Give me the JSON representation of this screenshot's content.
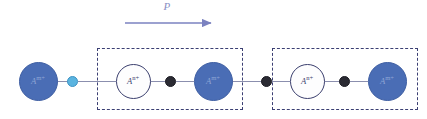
{
  "figure": {
    "width": 427,
    "height": 119,
    "background": "#ffffff",
    "type": "ionic-chain-polarization-schematic"
  },
  "polarization": {
    "label": "P",
    "label_color": "#8a8fc4",
    "arrow_color": "#7b82c0",
    "direction": "right",
    "arrow_x_start": 125,
    "arrow_x_end": 216,
    "arrow_y": 23,
    "label_x": 166,
    "label_y": 8
  },
  "colors": {
    "cation_m_fill": "#4a6db5",
    "cation_m_stroke": "#3f5fa3",
    "cation_m_text": "#8fa6d6",
    "cation_n_fill": "#fdfdfe",
    "cation_n_stroke": "#3b3f6e",
    "cation_n_text": "#3b3f6e",
    "anion_light": "#5ab4e0",
    "anion_dark": "#2b2b33",
    "bond": "#8b8fae",
    "unit_cell_border": "#3b3f73"
  },
  "chain": {
    "baseline_y": 81,
    "bond_segments": [
      {
        "x": 38,
        "width": 30
      },
      {
        "x": 78,
        "width": 38
      },
      {
        "x": 150,
        "width": 16
      },
      {
        "x": 176,
        "width": 18
      },
      {
        "x": 232,
        "width": 30
      },
      {
        "x": 272,
        "width": 18
      },
      {
        "x": 324,
        "width": 16
      },
      {
        "x": 350,
        "width": 18
      }
    ],
    "atoms": [
      {
        "id": "atom-1",
        "species": "A",
        "charge": "m+",
        "style": "filled",
        "cx": 38,
        "cy": 81,
        "d": 39
      },
      {
        "id": "atom-2",
        "species": "A",
        "charge": "n+",
        "style": "open",
        "cx": 133,
        "cy": 81,
        "d": 35
      },
      {
        "id": "atom-3",
        "species": "A",
        "charge": "m+",
        "style": "filled",
        "cx": 213,
        "cy": 81,
        "d": 39
      },
      {
        "id": "atom-4",
        "species": "A",
        "charge": "n+",
        "style": "open",
        "cx": 307,
        "cy": 81,
        "d": 35
      },
      {
        "id": "atom-5",
        "species": "A",
        "charge": "m+",
        "style": "filled",
        "cx": 387,
        "cy": 81,
        "d": 39
      }
    ],
    "ions": [
      {
        "id": "ion-1",
        "variant": "light",
        "cx": 72,
        "cy": 81,
        "d": 11
      },
      {
        "id": "ion-2",
        "variant": "dark",
        "cx": 170,
        "cy": 81,
        "d": 11
      },
      {
        "id": "ion-3",
        "variant": "dark",
        "cx": 266,
        "cy": 81,
        "d": 11
      },
      {
        "id": "ion-4",
        "variant": "dark",
        "cx": 344,
        "cy": 81,
        "d": 11
      }
    ],
    "unit_cells": [
      {
        "id": "unit-cell-1",
        "x": 97,
        "y": 48,
        "width": 146,
        "height": 62
      },
      {
        "id": "unit-cell-2",
        "x": 272,
        "y": 48,
        "width": 146,
        "height": 62
      }
    ]
  }
}
